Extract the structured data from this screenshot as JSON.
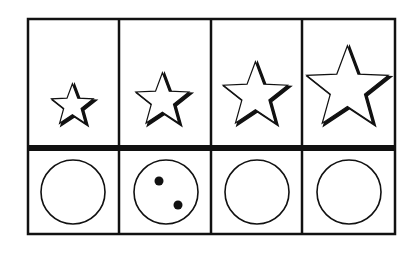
{
  "diagram": {
    "type": "pattern-grid",
    "rows": 2,
    "columns": 4,
    "line_color": "#111111",
    "background": "#ffffff",
    "frame": {
      "left": 28,
      "top": 19,
      "right": 395,
      "bottom": 234,
      "divider_y": 148
    },
    "column_dividers_x": [
      119,
      211,
      302
    ],
    "top_row": {
      "shape": "star",
      "cells": [
        {
          "cx": 73,
          "cy": 106,
          "r": 23
        },
        {
          "cx": 163,
          "cy": 101,
          "r": 29
        },
        {
          "cx": 256,
          "cy": 96,
          "r": 35
        },
        {
          "cx": 348,
          "cy": 89,
          "r": 44
        }
      ]
    },
    "bottom_row": {
      "shape": "circle",
      "cells": [
        {
          "cx": 73,
          "cy": 192,
          "r": 32,
          "dots": []
        },
        {
          "cx": 166,
          "cy": 192,
          "r": 32,
          "dots": [
            {
              "x": 159,
              "y": 181
            },
            {
              "x": 178,
              "y": 205
            }
          ]
        },
        {
          "cx": 257,
          "cy": 192,
          "r": 32,
          "dots": []
        },
        {
          "cx": 349,
          "cy": 192,
          "r": 32,
          "dots": []
        }
      ]
    }
  }
}
